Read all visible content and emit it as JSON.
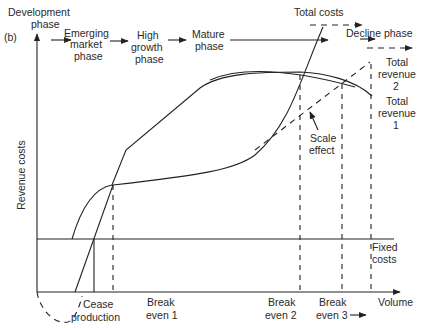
{
  "figure": {
    "panel_label": "(b)",
    "axes": {
      "y_label": "Revenue costs",
      "x_label": "Volume"
    },
    "phases": [
      {
        "label_line1": "Development",
        "label_line2": "phase"
      },
      {
        "label_line1": "Emerging",
        "label_line2": "market",
        "label_line3": "phase"
      },
      {
        "label_line1": "High",
        "label_line2": "growth",
        "label_line3": "phase"
      },
      {
        "label_line1": "Mature",
        "label_line2": "phase"
      },
      {
        "label_line1": "Decline phase"
      }
    ],
    "curves": {
      "total_costs": "Total costs",
      "total_revenue_2": {
        "line1": "Total",
        "line2": "revenue",
        "line3": "2"
      },
      "total_revenue_1": {
        "line1": "Total",
        "line2": "revenue",
        "line3": "1"
      },
      "fixed_costs": {
        "line1": "Fixed",
        "line2": "costs"
      },
      "scale_effect": {
        "line1": "Scale",
        "line2": "effect"
      }
    },
    "x_markers": [
      {
        "line1": "Cease",
        "line2": "production"
      },
      {
        "line1": "Break",
        "line2": "even 1"
      },
      {
        "line1": "Break",
        "line2": "even 2"
      },
      {
        "line1": "Break",
        "line2": "even 3"
      }
    ]
  }
}
